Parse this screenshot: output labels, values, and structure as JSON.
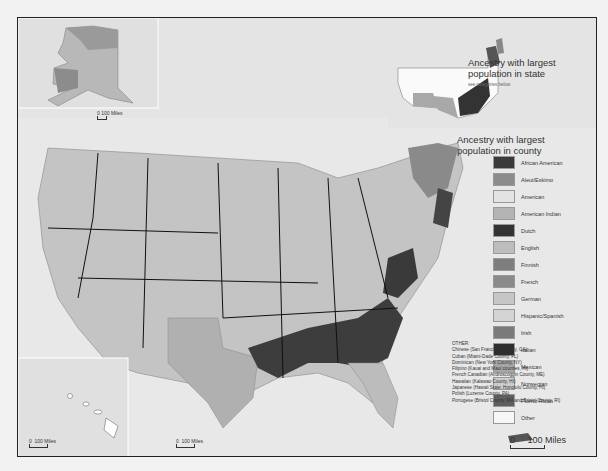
{
  "state_map": {
    "title": "Ancestry with largest population in state",
    "subtitle": "see categories below"
  },
  "county_map": {
    "title": "Ancestry with largest population in county"
  },
  "legend": {
    "items": [
      {
        "label": "African American",
        "color": "#3a3a3a"
      },
      {
        "label": "Aleut/Eskimo",
        "color": "#8c8c8c"
      },
      {
        "label": "American",
        "color": "#e3e3e3"
      },
      {
        "label": "American Indian",
        "color": "#b4b4b4"
      },
      {
        "label": "Dutch",
        "color": "#333333"
      },
      {
        "label": "English",
        "color": "#bdbdbd"
      },
      {
        "label": "Finnish",
        "color": "#7e7e7e"
      },
      {
        "label": "French",
        "color": "#8a8a8a"
      },
      {
        "label": "German",
        "color": "#c6c6c6"
      },
      {
        "label": "Hispanic/Spanish",
        "color": "#d4d4d4"
      },
      {
        "label": "Irish",
        "color": "#7a7a7a"
      },
      {
        "label": "Italian",
        "color": "#2e2e2e"
      },
      {
        "label": "Mexican",
        "color": "#a6a6a6"
      },
      {
        "label": "Norwegian",
        "color": "#cdcdcd"
      },
      {
        "label": "Puerto Rican",
        "color": "#5e5e5e"
      },
      {
        "label": "Other",
        "color": "#f7f7f7"
      }
    ]
  },
  "other_notes": {
    "heading": "OTHER:",
    "items": [
      "Chinese (San Francisco County, CA)",
      "Cuban (Miami-Dade County, FL)",
      "Dominican (New York County, NY)",
      "Filipino (Kauai and Maui counties, HI)",
      "French Canadian (Androscoggin County, ME)",
      "Hawaiian (Kalawao County, HI)",
      "Japanese (Hawaii State; Honolulu County, HI)",
      "Polish (Luzerne County, PA)",
      "Portugese (Bristol County, MA and Bristol County, RI)"
    ]
  },
  "scales": {
    "alaska": {
      "zero": "0",
      "label": "100 Miles"
    },
    "hawaii": {
      "zero": "0",
      "label": "100 Miles"
    },
    "conus": {
      "zero": "0",
      "label": "100 Miles"
    },
    "puerto_rico": {
      "zero": "0",
      "label": "100 Miles"
    }
  }
}
